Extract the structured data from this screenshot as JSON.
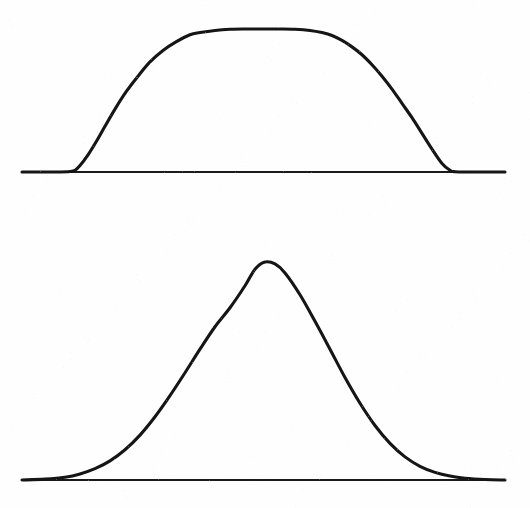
{
  "figure": {
    "background_color": "#fefefe",
    "ink_color": "#151515",
    "axis_color": "#1a1a1a",
    "width": 530,
    "height": 508,
    "title": "",
    "description": "Two hand-drawn distribution curves on plain white paper: an upper flat-topped (super-Gaussian / plateau) curve and a lower bell-shaped (Gaussian) curve, each sitting on its own horizontal baseline."
  },
  "chart_data": [
    {
      "type": "line",
      "name": "flat-top-curve",
      "title": "",
      "subtitle": "",
      "xlabel": "",
      "ylabel": "",
      "grid": false,
      "legend": "none",
      "axis_labels_visible": false,
      "tick_labels": [],
      "annotations": [],
      "baseline": {
        "y_pixel": 172,
        "x_start_pixel": 22,
        "x_end_pixel": 505
      },
      "shape": "super-gaussian plateau",
      "peak_amplitude": 1.0,
      "peak_y_pixel": 29,
      "plateau_x_start_pixel": 200,
      "plateau_x_end_pixel": 330,
      "foot_left_pixel": 73,
      "foot_right_pixel": 453,
      "center_pixel": 264,
      "supergaussian_order": 6,
      "sigma_pixel": 118,
      "x": [
        22,
        40,
        60,
        70,
        75,
        80,
        88,
        96,
        105,
        115,
        126,
        138,
        150,
        163,
        176,
        190,
        200,
        215,
        230,
        245,
        264,
        280,
        295,
        310,
        322,
        332,
        342,
        352,
        362,
        372,
        382,
        392,
        402,
        412,
        422,
        432,
        442,
        450,
        455,
        470,
        490,
        505
      ],
      "y": [
        0.0,
        0.0,
        0.0,
        0.003,
        0.012,
        0.045,
        0.12,
        0.21,
        0.32,
        0.44,
        0.56,
        0.67,
        0.77,
        0.85,
        0.91,
        0.96,
        0.975,
        0.99,
        0.998,
        1.0,
        1.0,
        1.0,
        0.998,
        0.99,
        0.975,
        0.955,
        0.92,
        0.875,
        0.82,
        0.75,
        0.67,
        0.58,
        0.48,
        0.38,
        0.27,
        0.16,
        0.06,
        0.012,
        0.002,
        0.0,
        0.0,
        0.0
      ],
      "ylim": [
        0,
        1.05
      ],
      "xlim": [
        22,
        505
      ]
    },
    {
      "type": "line",
      "name": "gaussian-curve",
      "title": "",
      "subtitle": "",
      "xlabel": "",
      "ylabel": "",
      "grid": false,
      "legend": "none",
      "axis_labels_visible": false,
      "tick_labels": [],
      "annotations": [],
      "baseline": {
        "y_pixel": 480,
        "x_start_pixel": 22,
        "x_end_pixel": 505
      },
      "shape": "gaussian bell",
      "peak_amplitude": 1.0,
      "peak_y_pixel": 262,
      "peak_x_pixel": 265,
      "foot_left_pixel": 70,
      "foot_right_pixel": 460,
      "center_pixel": 265,
      "sigma_pixel": 76,
      "fwhm_pixel": 180,
      "half_max_left_pixel": 175,
      "half_max_right_pixel": 355,
      "x": [
        22,
        45,
        65,
        80,
        95,
        110,
        125,
        140,
        155,
        170,
        185,
        200,
        215,
        230,
        245,
        255,
        265,
        275,
        285,
        300,
        315,
        330,
        345,
        360,
        375,
        390,
        405,
        420,
        435,
        450,
        465,
        485,
        505
      ],
      "y": [
        0.0,
        0.004,
        0.013,
        0.028,
        0.052,
        0.088,
        0.139,
        0.206,
        0.29,
        0.387,
        0.492,
        0.6,
        0.703,
        0.79,
        0.891,
        0.967,
        1.0,
        0.991,
        0.95,
        0.85,
        0.728,
        0.6,
        0.47,
        0.352,
        0.25,
        0.168,
        0.106,
        0.063,
        0.035,
        0.018,
        0.008,
        0.002,
        0.0
      ],
      "ylim": [
        0,
        1.05
      ],
      "xlim": [
        22,
        505
      ]
    }
  ]
}
